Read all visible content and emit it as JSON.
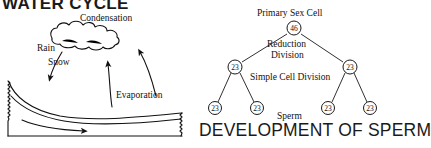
{
  "water_cycle": {
    "title": "WATER CYCLE",
    "labels": {
      "condensation": "Condensation",
      "rain": "Rain",
      "snow": "Snow",
      "evaporation": "Evaporation"
    }
  },
  "sperm_development": {
    "title": "DEVELOPMENT OF SPERM",
    "labels": {
      "primary_sex_cell": "Primary Sex Cell",
      "reduction": "Reduction",
      "division": "Division",
      "simple_cell_division": "Simple Cell Division",
      "sperm": "Sperm"
    },
    "nodes": {
      "root": "46",
      "mid_left": "23",
      "mid_right": "23",
      "leaf_1": "23",
      "leaf_2": "23",
      "leaf_3": "23",
      "leaf_4": "23"
    }
  },
  "colors": {
    "ink": "#111111",
    "background": "#ffffff"
  }
}
